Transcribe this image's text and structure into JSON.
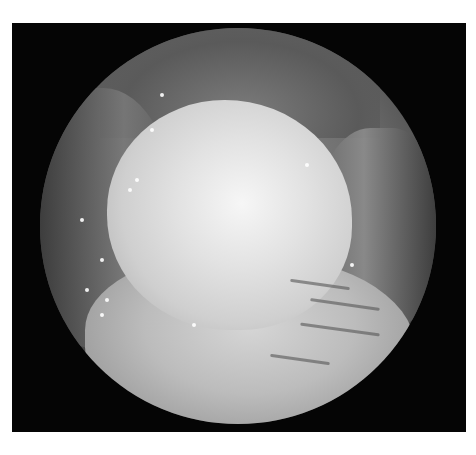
{
  "image": {
    "subject": "endoscopic-view",
    "description": "Grayscale circular endoscopic image showing a large pale rounded mass with surrounding folded tissue, inside a black rectangular frame on white background",
    "colors": {
      "page_background": "#ffffff",
      "frame": "#050505",
      "highlight": "#f6f6f6",
      "tissue_mid": "#8a8a8a",
      "tissue_dark": "#3a3a3a"
    }
  }
}
